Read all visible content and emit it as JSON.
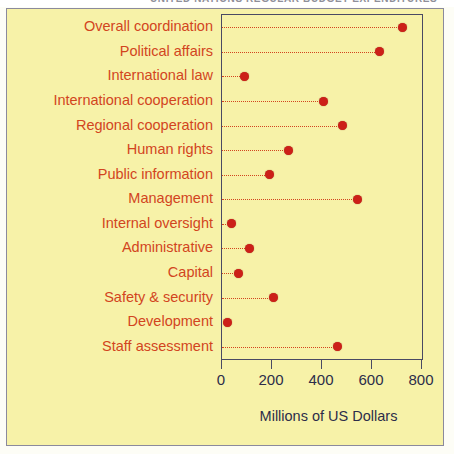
{
  "figure": {
    "top_caption_partial": "UNITED NATIONS REGULAR BUDGET EXPENDITURES",
    "panel_background": "#f7f2a8",
    "accent_red": "#cc2018",
    "label_red": "#d2451e",
    "axis_navy": "#2d2d4a"
  },
  "chart_data": {
    "type": "scatter",
    "title": "",
    "subtitle": "",
    "xlabel": "Millions of US Dollars",
    "ylabel": "",
    "orientation": "horizontal",
    "grid": false,
    "leader_lines": true,
    "legend": null,
    "xlim": [
      0,
      800
    ],
    "xticks": [
      0,
      200,
      400,
      600,
      800
    ],
    "xtick_labels": [
      "0",
      "200",
      "400",
      "600",
      "800"
    ],
    "categories": [
      "Overall coordination",
      "Political affairs",
      "International law",
      "International cooperation",
      "Regional cooperation",
      "Human rights",
      "Public information",
      "Management",
      "Internal oversight",
      "Administrative",
      "Capital",
      "Safety & security",
      "Development",
      "Staff assessment"
    ],
    "values": [
      720,
      630,
      90,
      405,
      480,
      265,
      190,
      540,
      37,
      110,
      65,
      205,
      20,
      460
    ],
    "marker": "circle",
    "marker_color": "#cc2018"
  }
}
